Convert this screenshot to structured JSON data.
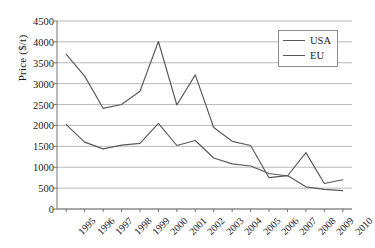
{
  "chart_data": {
    "type": "line",
    "title": "",
    "xlabel": "",
    "ylabel": "Price ($/t)",
    "categories": [
      "1995",
      "1996",
      "1997",
      "1998",
      "1999",
      "2000",
      "2001",
      "2002",
      "2003",
      "2004",
      "2005",
      "2006",
      "2007",
      "2008",
      "2009",
      "2010"
    ],
    "ylim": [
      0,
      4500
    ],
    "ytick_values": [
      0,
      500,
      1000,
      1500,
      2000,
      2500,
      3000,
      3500,
      4000,
      4500
    ],
    "ytick_labels": [
      "0",
      "500",
      "1000",
      "1500",
      "2000",
      "2500",
      "3000",
      "3500",
      "4000",
      "4500"
    ],
    "grid": true,
    "grid_axis": "y",
    "legend_position": "top-right",
    "series": [
      {
        "name": "USA",
        "color": "#595959",
        "values": [
          2020,
          1600,
          1440,
          1530,
          1570,
          2050,
          1520,
          1640,
          1220,
          1080,
          1030,
          850,
          790,
          1350,
          610,
          700
        ]
      },
      {
        "name": "EU",
        "color": "#595959",
        "values": [
          3700,
          3180,
          2410,
          2500,
          2820,
          4010,
          2490,
          3210,
          1950,
          1620,
          1520,
          750,
          800,
          530,
          470,
          440
        ]
      }
    ]
  },
  "legend": {
    "items": [
      {
        "label": "USA"
      },
      {
        "label": "EU"
      }
    ]
  },
  "axis": {
    "y_title": "Price ($/t)"
  }
}
